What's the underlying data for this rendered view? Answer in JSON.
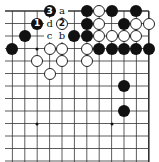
{
  "board": {
    "cols": 12,
    "rows": 13,
    "origin_x": 12.4,
    "origin_y": 11,
    "spacing_x": 12.4,
    "spacing_y": 12.5,
    "edges": {
      "top": true,
      "right": true,
      "left": false,
      "bottom": false
    },
    "line_color": "#333333"
  },
  "hoshi": [
    {
      "col": 2,
      "row": 3
    },
    {
      "col": 2,
      "row": 9
    },
    {
      "col": 8,
      "row": 9
    }
  ],
  "stones": [
    {
      "col": 3,
      "row": 0,
      "color": "black",
      "label": "3"
    },
    {
      "col": 6,
      "row": 0,
      "color": "black",
      "label": ""
    },
    {
      "col": 7,
      "row": 0,
      "color": "white",
      "label": ""
    },
    {
      "col": 8,
      "row": 0,
      "color": "black",
      "label": ""
    },
    {
      "col": 10,
      "row": 0,
      "color": "black",
      "label": ""
    },
    {
      "col": 2,
      "row": 1,
      "color": "black",
      "label": "1"
    },
    {
      "col": 4,
      "row": 1,
      "color": "white",
      "label": "2"
    },
    {
      "col": 6,
      "row": 1,
      "color": "black",
      "label": ""
    },
    {
      "col": 7,
      "row": 1,
      "color": "white",
      "label": ""
    },
    {
      "col": 9,
      "row": 1,
      "color": "black",
      "label": ""
    },
    {
      "col": 10,
      "row": 1,
      "color": "white",
      "label": ""
    },
    {
      "col": 11,
      "row": 1,
      "color": "white",
      "label": ""
    },
    {
      "col": 1,
      "row": 2,
      "color": "black",
      "label": ""
    },
    {
      "col": 5,
      "row": 2,
      "color": "black",
      "label": ""
    },
    {
      "col": 6,
      "row": 2,
      "color": "black",
      "label": ""
    },
    {
      "col": 7,
      "row": 2,
      "color": "white",
      "label": ""
    },
    {
      "col": 8,
      "row": 2,
      "color": "white",
      "label": ""
    },
    {
      "col": 9,
      "row": 2,
      "color": "white",
      "label": ""
    },
    {
      "col": 10,
      "row": 2,
      "color": "white",
      "label": ""
    },
    {
      "col": 0,
      "row": 3,
      "color": "black",
      "label": ""
    },
    {
      "col": 3,
      "row": 3,
      "color": "white",
      "label": ""
    },
    {
      "col": 4,
      "row": 3,
      "color": "white",
      "label": ""
    },
    {
      "col": 6,
      "row": 3,
      "color": "white",
      "label": ""
    },
    {
      "col": 7,
      "row": 3,
      "color": "black",
      "label": ""
    },
    {
      "col": 8,
      "row": 3,
      "color": "black",
      "label": ""
    },
    {
      "col": 9,
      "row": 3,
      "color": "black",
      "label": ""
    },
    {
      "col": 10,
      "row": 3,
      "color": "black",
      "label": ""
    },
    {
      "col": 11,
      "row": 3,
      "color": "black",
      "label": ""
    },
    {
      "col": 2,
      "row": 4,
      "color": "white",
      "label": ""
    },
    {
      "col": 4,
      "row": 4,
      "color": "white",
      "label": ""
    },
    {
      "col": 6,
      "row": 4,
      "color": "white",
      "label": ""
    },
    {
      "col": 3,
      "row": 5,
      "color": "white",
      "label": ""
    },
    {
      "col": 9,
      "row": 6,
      "color": "black",
      "label": ""
    },
    {
      "col": 9,
      "row": 8,
      "color": "black",
      "label": ""
    }
  ],
  "labels": [
    {
      "col": 4,
      "row": 0,
      "text": "a"
    },
    {
      "col": 4,
      "row": 2,
      "text": "b"
    },
    {
      "col": 3,
      "row": 2,
      "text": "c"
    },
    {
      "col": 3,
      "row": 1,
      "text": "d"
    }
  ]
}
